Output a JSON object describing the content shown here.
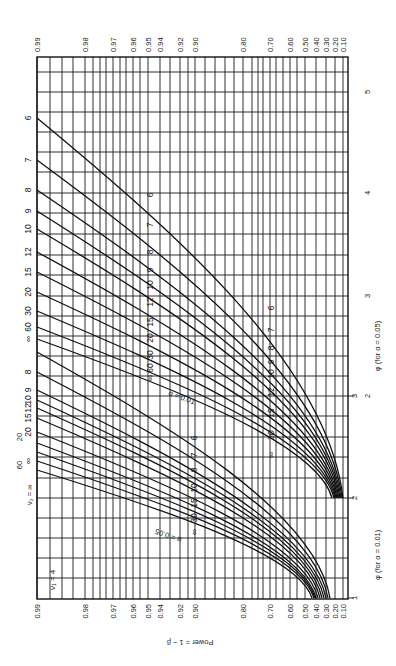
{
  "chart_data": {
    "type": "line",
    "orientation": "rotated 90° clockwise",
    "nu1_label": "ν₁ = 4",
    "ylabel": "Power = 1 − β",
    "xlabel_alpha05": "φ (for α = 0.05)",
    "xlabel_alpha01": "φ (for α = 0.01)",
    "power_ticks": [
      "0.99",
      "0.98",
      "0.97",
      "0.96",
      "0.95",
      "0.94",
      "0.92",
      "0.90",
      "0.80",
      "0.70",
      "0.60",
      "0.50",
      "0.40",
      "0.30",
      "0.20",
      "0.10"
    ],
    "phi_ticks_alpha05": [
      "5",
      "4",
      "3",
      "2"
    ],
    "phi_ticks_alpha01": [
      "3",
      "2",
      "1"
    ],
    "phi_range_alpha05": [
      1,
      5.3
    ],
    "phi_range_alpha01": [
      1,
      3.0
    ],
    "grid": true,
    "nu2_values": [
      "6",
      "7",
      "8",
      "9",
      "10",
      "12",
      "15",
      "20",
      "30",
      "60",
      "∞"
    ],
    "series": [
      {
        "name": "α = 0.05",
        "label": "α = 0.05",
        "curves": [
          {
            "nu2": "6",
            "start_px": [
              37,
              352
            ],
            "end_px": [
              330,
              598
            ]
          },
          {
            "nu2": "7",
            "start_px": [
              37,
              372
            ],
            "end_px": [
              328,
              598
            ]
          },
          {
            "nu2": "8",
            "start_px": [
              37,
              390
            ],
            "end_px": [
              326,
              598
            ]
          },
          {
            "nu2": "9",
            "start_px": [
              37,
              400
            ],
            "end_px": [
              324,
              598
            ]
          },
          {
            "nu2": "10",
            "start_px": [
              37,
              408
            ],
            "end_px": [
              322,
              598
            ]
          },
          {
            "nu2": "12",
            "start_px": [
              37,
              418
            ],
            "end_px": [
              320,
              598
            ]
          },
          {
            "nu2": "15",
            "start_px": [
              37,
              432
            ],
            "end_px": [
              318,
              598
            ]
          },
          {
            "nu2": "20",
            "start_px": [
              37,
              443
            ],
            "end_px": [
              316,
              598
            ]
          },
          {
            "nu2": "30",
            "start_px": [
              37,
              452
            ],
            "end_px": [
              315,
              598
            ]
          },
          {
            "nu2": "60",
            "start_px": [
              37,
              461
            ],
            "end_px": [
              314,
              598
            ]
          },
          {
            "nu2": "∞",
            "start_px": [
              37,
              470
            ],
            "end_px": [
              312,
              598
            ]
          }
        ]
      },
      {
        "name": "α = 0.01",
        "label": "α = 0.01",
        "curves": [
          {
            "nu2": "6",
            "start_px": [
              37,
              118
            ],
            "end_px": [
              343,
              498
            ]
          },
          {
            "nu2": "7",
            "start_px": [
              37,
              160
            ],
            "end_px": [
              342,
              498
            ]
          },
          {
            "nu2": "8",
            "start_px": [
              37,
              190
            ],
            "end_px": [
              341,
              498
            ]
          },
          {
            "nu2": "9",
            "start_px": [
              37,
              211
            ],
            "end_px": [
              340,
              498
            ]
          },
          {
            "nu2": "10",
            "start_px": [
              37,
              229
            ],
            "end_px": [
              339,
              498
            ]
          },
          {
            "nu2": "12",
            "start_px": [
              37,
              252
            ],
            "end_px": [
              338,
              498
            ]
          },
          {
            "nu2": "15",
            "start_px": [
              37,
              272
            ],
            "end_px": [
              337,
              498
            ]
          },
          {
            "nu2": "20",
            "start_px": [
              37,
              292
            ],
            "end_px": [
              336,
              498
            ]
          },
          {
            "nu2": "30",
            "start_px": [
              37,
              311
            ],
            "end_px": [
              335,
              498
            ]
          },
          {
            "nu2": "60",
            "start_px": [
              37,
              327
            ],
            "end_px": [
              334,
              498
            ]
          },
          {
            "nu2": "∞",
            "start_px": [
              37,
              339
            ],
            "end_px": [
              332,
              498
            ]
          }
        ]
      }
    ]
  },
  "layout": {
    "frame": {
      "x0": 37,
      "y0": 57,
      "x1": 348,
      "y1": 599
    },
    "power_tick_x": [
      37,
      85,
      113,
      133,
      148,
      160,
      180,
      195,
      243,
      270,
      290,
      305,
      316,
      326,
      335,
      343
    ],
    "extra_vertical_grid_x": [
      50,
      62,
      73,
      93,
      100,
      106,
      120,
      126,
      140,
      170,
      188,
      205,
      215,
      225,
      234,
      252,
      258,
      263,
      276,
      283,
      297
    ],
    "phi05_tick_y": [
      92,
      193,
      296,
      396
    ],
    "phi01_tick_y": [
      396,
      498,
      598
    ],
    "horizontal_grid_y": [
      72,
      92,
      112,
      132,
      152,
      172,
      193,
      213,
      234,
      255,
      275,
      296,
      316,
      336,
      356,
      376,
      396,
      416,
      437,
      457,
      478,
      498,
      518,
      538,
      558,
      578
    ]
  },
  "labels": {
    "alpha01_curve_tags_right": [
      "6",
      "7",
      "8",
      "9",
      "10",
      "12",
      "15",
      "20",
      "30",
      "60",
      "∞"
    ],
    "alpha01_curve_tags_left": [
      "6",
      "7",
      "8",
      "9",
      "10",
      "12",
      "15",
      "20",
      "30",
      "60",
      "∞"
    ],
    "alpha05_curve_tags_mid": [
      "6",
      "7",
      "8",
      "10",
      "15",
      "30",
      "∞"
    ],
    "alpha05_curve_tags_left": [
      "8",
      "9",
      "10",
      "12",
      "15",
      "20",
      "30",
      "60",
      "∞"
    ],
    "alpha01_word": "α = 0.01",
    "alpha05_word": "α = 0.05",
    "nu2_eq": "ν₂ = ∞",
    "nu2_top_labels": [
      "60",
      "20"
    ]
  }
}
